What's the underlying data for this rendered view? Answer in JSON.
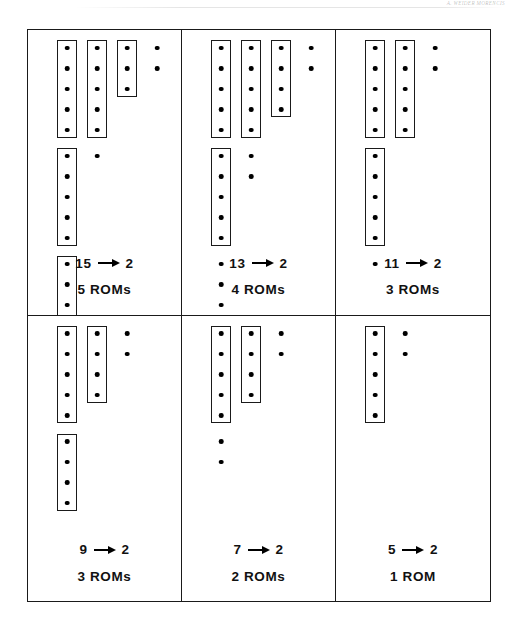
{
  "running_head": {
    "text": "A. WEIDER MORENCIS"
  },
  "figure": {
    "layout": {
      "columns": 3,
      "rows": 2
    },
    "panels": [
      {
        "id": "panel-15-to-2",
        "map_from": "15",
        "map_to": "2",
        "arrow": "arrow-right-icon",
        "rom_count_label": "5 ROMs",
        "columns": [
          {
            "id": "stage-1",
            "total_dots": 15,
            "groups": [
              {
                "boxed": true,
                "dots": 5
              },
              {
                "boxed": true,
                "dots": 5
              },
              {
                "boxed": true,
                "dots": 5
              }
            ]
          },
          {
            "id": "stage-2",
            "total_dots": 6,
            "groups": [
              {
                "boxed": true,
                "dots": 5
              },
              {
                "boxed": false,
                "dots": 1
              }
            ]
          },
          {
            "id": "stage-3",
            "total_dots": 3,
            "groups": [
              {
                "boxed": true,
                "dots": 3
              }
            ]
          },
          {
            "id": "stage-4",
            "total_dots": 2,
            "groups": [
              {
                "boxed": false,
                "dots": 2
              }
            ]
          }
        ]
      },
      {
        "id": "panel-13-to-2",
        "map_from": "13",
        "map_to": "2",
        "arrow": "arrow-right-icon",
        "rom_count_label": "4 ROMs",
        "columns": [
          {
            "id": "stage-1",
            "total_dots": 13,
            "groups": [
              {
                "boxed": true,
                "dots": 5
              },
              {
                "boxed": true,
                "dots": 5
              },
              {
                "boxed": false,
                "dots": 3
              }
            ]
          },
          {
            "id": "stage-2",
            "total_dots": 7,
            "groups": [
              {
                "boxed": true,
                "dots": 5
              },
              {
                "boxed": false,
                "dots": 2
              }
            ]
          },
          {
            "id": "stage-3",
            "total_dots": 4,
            "groups": [
              {
                "boxed": true,
                "dots": 4
              }
            ]
          },
          {
            "id": "stage-4",
            "total_dots": 2,
            "groups": [
              {
                "boxed": false,
                "dots": 2
              }
            ]
          }
        ]
      },
      {
        "id": "panel-11-to-2",
        "map_from": "11",
        "map_to": "2",
        "arrow": "arrow-right-icon",
        "rom_count_label": "3 ROMs",
        "columns": [
          {
            "id": "stage-1",
            "total_dots": 11,
            "groups": [
              {
                "boxed": true,
                "dots": 5
              },
              {
                "boxed": true,
                "dots": 5
              },
              {
                "boxed": false,
                "dots": 1
              }
            ]
          },
          {
            "id": "stage-2",
            "total_dots": 5,
            "groups": [
              {
                "boxed": true,
                "dots": 5
              }
            ]
          },
          {
            "id": "stage-3",
            "total_dots": 2,
            "groups": [
              {
                "boxed": false,
                "dots": 2
              }
            ]
          }
        ]
      },
      {
        "id": "panel-9-to-2",
        "map_from": "9",
        "map_to": "2",
        "arrow": "arrow-right-icon",
        "rom_count_label": "3 ROMs",
        "columns": [
          {
            "id": "stage-1",
            "total_dots": 9,
            "groups": [
              {
                "boxed": true,
                "dots": 5
              },
              {
                "boxed": true,
                "dots": 4
              }
            ]
          },
          {
            "id": "stage-2",
            "total_dots": 4,
            "groups": [
              {
                "boxed": true,
                "dots": 4
              }
            ]
          },
          {
            "id": "stage-3",
            "total_dots": 2,
            "groups": [
              {
                "boxed": false,
                "dots": 2
              }
            ]
          }
        ]
      },
      {
        "id": "panel-7-to-2",
        "map_from": "7",
        "map_to": "2",
        "arrow": "arrow-right-icon",
        "rom_count_label": "2 ROMs",
        "columns": [
          {
            "id": "stage-1",
            "total_dots": 7,
            "groups": [
              {
                "boxed": true,
                "dots": 5
              },
              {
                "boxed": false,
                "dots": 2
              }
            ]
          },
          {
            "id": "stage-2",
            "total_dots": 4,
            "groups": [
              {
                "boxed": true,
                "dots": 4
              }
            ]
          },
          {
            "id": "stage-3",
            "total_dots": 2,
            "groups": [
              {
                "boxed": false,
                "dots": 2
              }
            ]
          }
        ]
      },
      {
        "id": "panel-5-to-2",
        "map_from": "5",
        "map_to": "2",
        "arrow": "arrow-right-icon",
        "rom_count_label": "1 ROM",
        "columns": [
          {
            "id": "stage-1",
            "total_dots": 5,
            "groups": [
              {
                "boxed": true,
                "dots": 5
              }
            ]
          },
          {
            "id": "stage-2",
            "total_dots": 2,
            "groups": [
              {
                "boxed": false,
                "dots": 2
              }
            ]
          }
        ]
      }
    ]
  },
  "colors": {
    "ink": "#1a1a1a",
    "dot": "#000000",
    "paper": "#ffffff"
  }
}
